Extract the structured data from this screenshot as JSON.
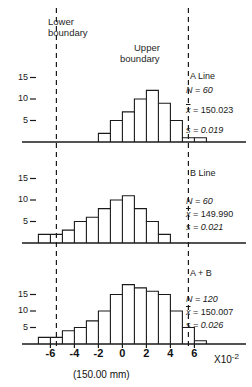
{
  "figure": {
    "caption": "(150.00 mm)",
    "x_axis_unit_prefix": "X10",
    "x_axis_unit_exp": "-2",
    "boundary_labels": {
      "lower_line1": "Lower",
      "lower_line2": "boundary",
      "upper_line1": "Upper",
      "upper_line2": "boundary"
    },
    "boundary_values": {
      "lower": -5.5,
      "upper": 5.5
    },
    "x_ticks": [
      "-6",
      "-4",
      "-2",
      "0",
      "2",
      "4",
      "6"
    ],
    "x_tick_values": [
      -6,
      -4,
      -2,
      0,
      2,
      4,
      6
    ],
    "y_ticks": [
      "15",
      "10",
      "5"
    ],
    "y_tick_values": [
      15,
      10,
      5
    ]
  },
  "panels": [
    {
      "title": "A Line",
      "n_label": "N = 60",
      "mean_symbol": "x",
      "mean_label": "= 150.023",
      "s_label": "s = 0.019",
      "n": 60,
      "mean": 150.023,
      "s": 0.019
    },
    {
      "title": "B Line",
      "n_label": "N = 60",
      "mean_symbol": "x",
      "mean_label": "= 149.990",
      "s_label": "s = 0.021",
      "n": 60,
      "mean": 149.99,
      "s": 0.021
    },
    {
      "title": "A + B",
      "n_label": "N = 120",
      "mean_symbol": "x",
      "mean_label": "= 150.007",
      "s_label": "s = 0.026",
      "n": 120,
      "mean": 150.007,
      "s": 0.026
    }
  ],
  "chart_data": [
    {
      "type": "bar",
      "title": "A Line",
      "xlabel": "(150.00 mm)",
      "ylabel": "frequency",
      "xlim": [
        -7,
        7
      ],
      "ylim": [
        0,
        18
      ],
      "grid": false,
      "bin_width": 1,
      "bin_centers": [
        -1.5,
        -0.5,
        0.5,
        1.5,
        2.5,
        3.5,
        4.5,
        5.5,
        6.5
      ],
      "categories": [
        "-2..-1",
        "-1..0",
        "0..1",
        "1..2",
        "2..3",
        "3..4",
        "4..5",
        "5..6",
        "6..7"
      ],
      "values": [
        2,
        5,
        7,
        10,
        12,
        9,
        5,
        1,
        1
      ],
      "annotations": [
        "N = 60",
        "x̄ = 150.023",
        "s = 0.019"
      ],
      "vlines": [
        -5.5,
        5.5
      ]
    },
    {
      "type": "bar",
      "title": "B Line",
      "xlabel": "(150.00 mm)",
      "ylabel": "frequency",
      "xlim": [
        -7,
        7
      ],
      "ylim": [
        0,
        18
      ],
      "grid": false,
      "bin_width": 1,
      "bin_centers": [
        -6.5,
        -5.5,
        -4.5,
        -3.5,
        -2.5,
        -1.5,
        -0.5,
        0.5,
        1.5,
        2.5,
        3.5
      ],
      "categories": [
        "-7..-6",
        "-6..-5",
        "-5..-4",
        "-4..-3",
        "-3..-2",
        "-2..-1",
        "-1..0",
        "0..1",
        "1..2",
        "2..3",
        "3..4"
      ],
      "values": [
        2,
        2,
        3,
        5,
        6,
        8,
        10,
        11,
        8,
        5,
        2
      ],
      "annotations": [
        "N = 60",
        "x̄ = 149.990",
        "s = 0.021"
      ],
      "vlines": [
        -5.5,
        5.5
      ]
    },
    {
      "type": "bar",
      "title": "A + B",
      "xlabel": "(150.00 mm)",
      "ylabel": "frequency",
      "xlim": [
        -7,
        7
      ],
      "ylim": [
        0,
        20
      ],
      "grid": false,
      "bin_width": 1,
      "bin_centers": [
        -6.5,
        -5.5,
        -4.5,
        -3.5,
        -2.5,
        -1.5,
        -0.5,
        0.5,
        1.5,
        2.5,
        3.5,
        4.5,
        5.5,
        6.5
      ],
      "categories": [
        "-7..-6",
        "-6..-5",
        "-5..-4",
        "-4..-3",
        "-3..-2",
        "-2..-1",
        "-1..0",
        "0..1",
        "1..2",
        "2..3",
        "3..4",
        "4..5",
        "5..6",
        "6..7"
      ],
      "values": [
        2,
        2,
        4,
        5,
        7,
        10,
        15,
        18,
        17,
        16,
        15,
        10,
        5,
        1
      ],
      "annotations": [
        "N = 120",
        "x̄ = 150.007",
        "s = 0.026"
      ],
      "vlines": [
        -5.5,
        5.5
      ]
    }
  ]
}
